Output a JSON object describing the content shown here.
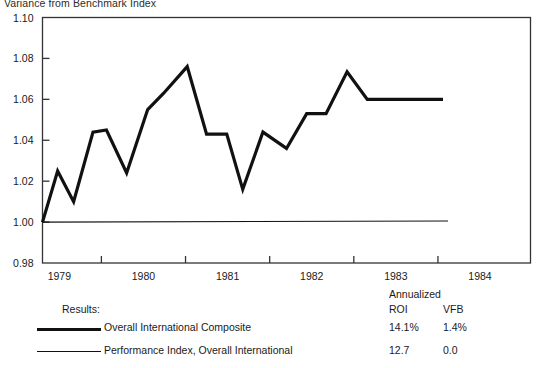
{
  "chart_title": "Variance from Benchmark Index",
  "legend": {
    "annualized_header": "Annualized",
    "results_label": "Results:",
    "roi_header": "ROI",
    "vfb_header": "VFB",
    "entries": [
      {
        "name": "Overall International Composite",
        "roi": "14.1%",
        "vfb": "1.4%",
        "style": "thick"
      },
      {
        "name": "Performance Index, Overall International",
        "roi": "12.7",
        "vfb": "0.0",
        "style": "thin"
      }
    ]
  },
  "colors": {
    "line": "#111111",
    "axis": "#333333",
    "text": "#1a1a1a"
  },
  "chart_data": {
    "type": "line",
    "title": "Variance from Benchmark Index",
    "xlabel": "",
    "ylabel": "",
    "grid": false,
    "legend_position": "below",
    "xlim": [
      1978.8,
      1984.6
    ],
    "ylim": [
      0.98,
      1.1
    ],
    "ytick_labels": [
      "0.98",
      "1.00",
      "1.02",
      "1.04",
      "1.06",
      "1.08",
      "1.10"
    ],
    "yticks": [
      0.98,
      1.0,
      1.02,
      1.04,
      1.06,
      1.08,
      1.1
    ],
    "xtick_labels": [
      "1979",
      "1980",
      "1981",
      "1982",
      "1983",
      "1984"
    ],
    "xticks": [
      1979,
      1980,
      1981,
      1982,
      1983,
      1984
    ],
    "series": [
      {
        "name": "Overall International Composite",
        "style": "thick",
        "x": [
          1978.8,
          1978.98,
          1979.17,
          1979.4,
          1979.56,
          1979.8,
          1980.05,
          1980.24,
          1980.52,
          1980.75,
          1980.99,
          1981.18,
          1981.42,
          1981.7,
          1981.94,
          1982.17,
          1982.42,
          1982.66,
          1982.9,
          1983.12,
          1983.33,
          1983.56
        ],
        "y": [
          1.0,
          1.025,
          1.01,
          1.044,
          1.045,
          1.024,
          1.055,
          1.063,
          1.076,
          1.043,
          1.043,
          1.016,
          1.044,
          1.036,
          1.053,
          1.053,
          1.0735,
          1.06,
          1.06,
          1.06,
          1.06,
          1.06
        ]
      },
      {
        "name": "Performance Index, Overall International",
        "style": "thin",
        "x": [
          1978.8,
          1983.62
        ],
        "y": [
          1.0,
          1.0005
        ]
      }
    ]
  }
}
